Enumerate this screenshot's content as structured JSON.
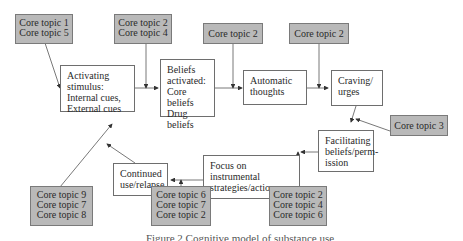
{
  "diagram": {
    "process_boxes": [
      {
        "id": "activating-stimulus",
        "lines": [
          "Activating",
          "stimulus:",
          "Internal cues,",
          "External cues"
        ]
      },
      {
        "id": "beliefs-activated",
        "lines": [
          "Beliefs",
          "activated:",
          "Core beliefs",
          "Drug beliefs"
        ]
      },
      {
        "id": "automatic-thoughts",
        "lines": [
          "Automatic",
          "thoughts"
        ]
      },
      {
        "id": "craving-urges",
        "lines": [
          "Craving/",
          "urges"
        ]
      },
      {
        "id": "facilitating-beliefs",
        "lines": [
          "Facilitating",
          "beliefs/perm-",
          "ission"
        ]
      },
      {
        "id": "focus-instrumental",
        "lines": [
          "Focus on",
          "instrumental",
          "strategies/action"
        ]
      },
      {
        "id": "continued-use",
        "lines": [
          "Continued",
          "use/relapse"
        ]
      }
    ],
    "topic_boxes": [
      {
        "id": "topics-1-5",
        "lines": [
          "Core topic 1",
          "Core topic 5"
        ],
        "target": "activating-stimulus"
      },
      {
        "id": "topics-2-4",
        "lines": [
          "Core topic 2",
          "Core topic 4"
        ],
        "target": "beliefs-activated"
      },
      {
        "id": "topic-2-a",
        "lines": [
          "Core topic 2"
        ],
        "target": "automatic-thoughts"
      },
      {
        "id": "topic-2-b",
        "lines": [
          "Core topic 2"
        ],
        "target": "craving-urges"
      },
      {
        "id": "topic-3",
        "lines": [
          "Core topic 3"
        ],
        "target": "facilitating-beliefs"
      },
      {
        "id": "topics-2-4-6",
        "lines": [
          "Core topic 2",
          "Core topic 4",
          "Core topic 6"
        ],
        "target": "focus-instrumental"
      },
      {
        "id": "topics-6-7-2",
        "lines": [
          "Core topic 6",
          "Core topic 7",
          "Core topic 2"
        ],
        "target": "continued-use"
      },
      {
        "id": "topics-9-7-8",
        "lines": [
          "Core topic 9",
          "Core topic 7",
          "Core topic 8"
        ],
        "target": "activating-stimulus"
      }
    ],
    "caption": "Figure 2 Cognitive model of substance use"
  }
}
